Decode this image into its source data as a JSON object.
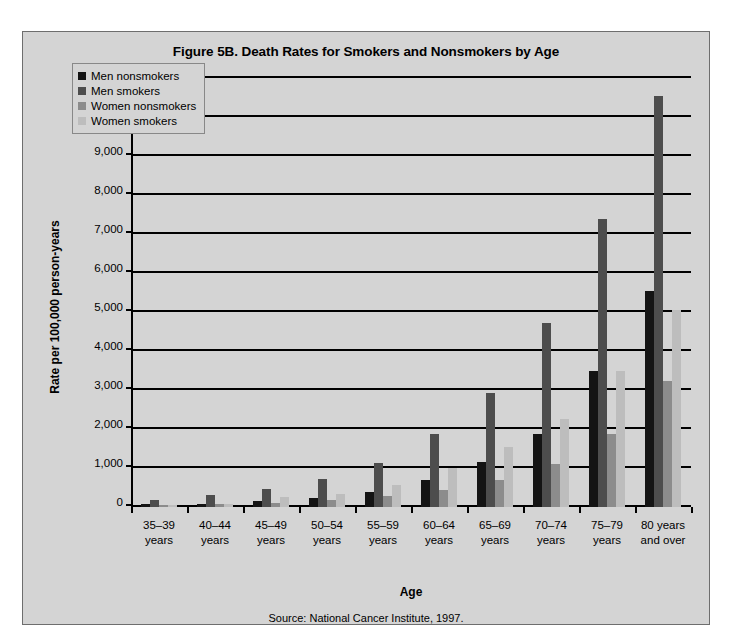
{
  "figure": {
    "title": "Figure 5B. Death Rates for Smokers and Nonsmokers by Age",
    "source": "Source: National Cancer Institute, 1997.",
    "x_axis_title": "Age",
    "y_axis_title": "Rate per 100,000 person-years"
  },
  "chart_data": {
    "type": "bar",
    "title": "Figure 5B. Death Rates for Smokers and Nonsmokers by Age",
    "xlabel": "Age",
    "ylabel": "Rate per 100,000 person-years",
    "ylim": [
      0,
      11000
    ],
    "ytick_values": [
      0,
      1000,
      2000,
      3000,
      4000,
      5000,
      6000,
      7000,
      8000,
      9000,
      10000,
      11000
    ],
    "ytick_labels": [
      "0",
      "1,000",
      "2,000",
      "3,000",
      "4,000",
      "5,000",
      "6,000",
      "7,000",
      "8,000",
      "9,000",
      "10,000",
      "11,000"
    ],
    "grid": true,
    "legend_position": "top-left inside plot",
    "categories": [
      "35–39\nyears",
      "40–44\nyears",
      "45–49\nyears",
      "50–54\nyears",
      "55–59\nyears",
      "60–64\nyears",
      "65–69\nyears",
      "70–74\nyears",
      "75–79\nyears",
      "80 years\nand over"
    ],
    "series": [
      {
        "name": "Men nonsmokers",
        "color": "#141414",
        "values": [
          70,
          90,
          150,
          220,
          390,
          680,
          1150,
          1880,
          3480,
          5530
        ]
      },
      {
        "name": "Men smokers",
        "color": "#4d4d4d",
        "values": [
          190,
          310,
          460,
          720,
          1120,
          1870,
          2930,
          4730,
          7390,
          10530
        ]
      },
      {
        "name": "Women nonsmokers",
        "color": "#8c8c8c",
        "values": [
          50,
          70,
          110,
          180,
          270,
          440,
          690,
          1100,
          1880,
          3230
        ]
      },
      {
        "name": "Women smokers",
        "color": "#bdbdbd",
        "values": [
          60,
          90,
          250,
          330,
          560,
          1000,
          1540,
          2260,
          3480,
          5060
        ]
      }
    ]
  },
  "legend": {
    "items": [
      {
        "label": "Men nonsmokers",
        "color": "#141414"
      },
      {
        "label": "Men smokers",
        "color": "#4d4d4d"
      },
      {
        "label": "Women nonsmokers",
        "color": "#8c8c8c"
      },
      {
        "label": "Women smokers",
        "color": "#bdbdbd"
      }
    ]
  }
}
